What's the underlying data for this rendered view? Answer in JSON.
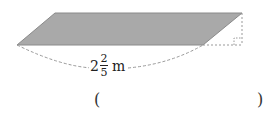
{
  "figure": {
    "shape": "parallelogram",
    "fill_color": "#a9a9a9",
    "stroke_color": "#808080",
    "base_label": {
      "whole": "2",
      "numerator": "2",
      "denominator": "5",
      "unit": "m"
    },
    "right_angle_marker": true
  },
  "answer": {
    "open_paren": "(",
    "close_paren": ")",
    "value": ""
  }
}
